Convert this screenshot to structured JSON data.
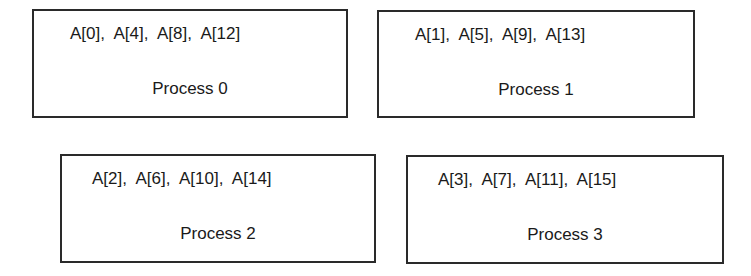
{
  "diagram": {
    "type": "block-distribution",
    "processes": [
      {
        "label": "Process 0",
        "elements": "A[0],  A[4],  A[8],  A[12]"
      },
      {
        "label": "Process 1",
        "elements": "A[1],  A[5],  A[9],  A[13]"
      },
      {
        "label": "Process 2",
        "elements": "A[2],  A[6],  A[10],  A[14]"
      },
      {
        "label": "Process 3",
        "elements": "A[3],  A[7],  A[11],  A[15]"
      }
    ],
    "colors": {
      "border": "#2a2a2a",
      "text": "#1a1a1a",
      "background": "#ffffff"
    }
  }
}
